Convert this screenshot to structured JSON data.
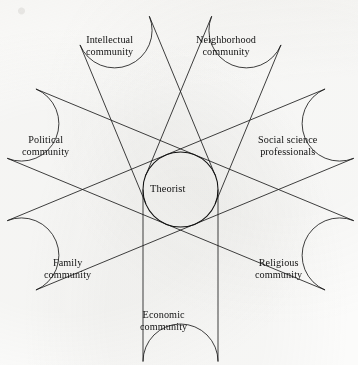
{
  "figure": {
    "type": "radial-petal-diagram",
    "title": "",
    "center": {
      "label": "Theorist"
    },
    "petals": [
      {
        "id": "intellectual",
        "line1": "Intellectual",
        "line2": "community",
        "angle_deg": 292.5,
        "label_x": 86,
        "label_y": 34
      },
      {
        "id": "neighborhood",
        "line1": "Neighborhood",
        "line2": "community",
        "angle_deg": 247.5,
        "label_x": 196,
        "label_y": 34
      },
      {
        "id": "political",
        "line1": "Political",
        "line2": "community",
        "angle_deg": 337.5,
        "label_x": 22,
        "label_y": 134
      },
      {
        "id": "social-science",
        "line1": "Social science",
        "line2": "professionals",
        "angle_deg": 202.5,
        "label_x": 258,
        "label_y": 134
      },
      {
        "id": "family",
        "line1": "Family",
        "line2": "community",
        "angle_deg": 22.5,
        "label_x": 44,
        "label_y": 257
      },
      {
        "id": "religious",
        "line1": "Religious",
        "line2": "community",
        "angle_deg": 157.5,
        "label_x": 255,
        "label_y": 257
      },
      {
        "id": "economic",
        "line1": "Economic",
        "line2": "community",
        "angle_deg": 90.0,
        "label_x": 140,
        "label_y": 309
      }
    ],
    "colors": {
      "stroke": "#1c1c1c",
      "background": "#fbfbfa",
      "text": "#111111"
    }
  }
}
